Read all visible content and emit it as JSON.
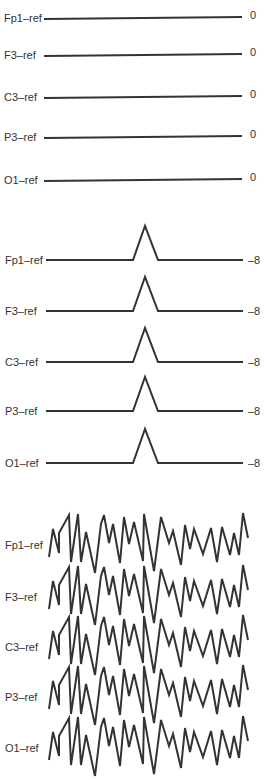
{
  "chart_data": [
    {
      "type": "line",
      "title": "",
      "panel": "flat",
      "channels": [
        "Fp1–ref",
        "F3–ref",
        "C3–ref",
        "P3–ref",
        "O1–ref"
      ],
      "values": [
        0,
        0,
        0,
        0,
        0
      ],
      "description": "Flat traces, all channels at 0"
    },
    {
      "type": "line",
      "title": "",
      "panel": "spike",
      "channels": [
        "Fp1–ref",
        "F3–ref",
        "C3–ref",
        "P3–ref",
        "O1–ref"
      ],
      "values": [
        -8,
        -8,
        -8,
        -8,
        -8
      ],
      "description": "Identical single triangular deflection on every channel"
    },
    {
      "type": "line",
      "title": "",
      "panel": "noise",
      "channels": [
        "Fp1–ref",
        "F3–ref",
        "C3–ref",
        "P3–ref",
        "O1–ref"
      ],
      "description": "Identical irregular high-amplitude waveform on every channel"
    }
  ],
  "panels": {
    "flat": {
      "rows": [
        {
          "label": "Fp1–ref",
          "value": "0",
          "y": 18
        },
        {
          "label": "F3–ref",
          "value": "0",
          "y": 55
        },
        {
          "label": "C3–ref",
          "value": "0",
          "y": 97
        },
        {
          "label": "P3–ref",
          "value": "0",
          "y": 137
        },
        {
          "label": "O1–ref",
          "value": "0",
          "y": 180
        }
      ]
    },
    "spike": {
      "rows": [
        {
          "label": "Fp1–ref",
          "value": "–8",
          "y": 260
        },
        {
          "label": "F3–ref",
          "value": "–8",
          "y": 311
        },
        {
          "label": "C3–ref",
          "value": "–8",
          "y": 362
        },
        {
          "label": "P3–ref",
          "value": "–8",
          "y": 411
        },
        {
          "label": "O1–ref",
          "value": "–8",
          "y": 463
        }
      ],
      "shape": [
        [
          46,
          0
        ],
        [
          133,
          0
        ],
        [
          145,
          -34
        ],
        [
          158,
          0
        ],
        [
          243,
          0
        ]
      ]
    },
    "noise": {
      "rows": [
        {
          "label": "Fp1–ref",
          "y": 545
        },
        {
          "label": "F3–ref",
          "y": 597
        },
        {
          "label": "C3–ref",
          "y": 647
        },
        {
          "label": "P3–ref",
          "y": 697
        },
        {
          "label": "O1–ref",
          "y": 748
        }
      ],
      "shape": [
        [
          49,
          12
        ],
        [
          53,
          -16
        ],
        [
          59,
          8
        ],
        [
          59,
          -12
        ],
        [
          69,
          -30
        ],
        [
          71,
          17
        ],
        [
          78,
          -31
        ],
        [
          81,
          17
        ],
        [
          86,
          -13
        ],
        [
          95,
          28
        ],
        [
          101,
          -21
        ],
        [
          104,
          -30
        ],
        [
          109,
          -2
        ],
        [
          113,
          -21
        ],
        [
          120,
          18
        ],
        [
          124,
          -28
        ],
        [
          129,
          -1
        ],
        [
          134,
          -23
        ],
        [
          143,
          16
        ],
        [
          144,
          -31
        ],
        [
          154,
          26
        ],
        [
          161,
          -28
        ],
        [
          169,
          -2
        ],
        [
          173,
          -14
        ],
        [
          181,
          20
        ],
        [
          185,
          -20
        ],
        [
          190,
          4
        ],
        [
          194,
          -16
        ],
        [
          203,
          9
        ],
        [
          211,
          -17
        ],
        [
          217,
          17
        ],
        [
          222,
          -18
        ],
        [
          230,
          10
        ],
        [
          234,
          -12
        ],
        [
          239,
          10
        ],
        [
          243,
          -32
        ],
        [
          248,
          -7
        ]
      ]
    }
  }
}
